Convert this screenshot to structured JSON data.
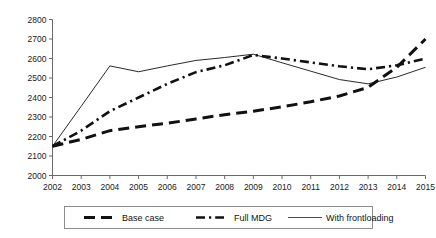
{
  "chart_data": {
    "type": "line",
    "title": "",
    "subtitle": "",
    "xlabel": "",
    "ylabel": "",
    "grid": false,
    "legend_position": "bottom",
    "x": [
      2002,
      2003,
      2004,
      2005,
      2006,
      2007,
      2008,
      2009,
      2010,
      2011,
      2012,
      2013,
      2014,
      2015
    ],
    "categories": [
      "2002",
      "2003",
      "2004",
      "2005",
      "2006",
      "2007",
      "2008",
      "2009",
      "2010",
      "2011",
      "2012",
      "2013",
      "2014",
      "2015"
    ],
    "xlim": [
      2002,
      2015
    ],
    "ylim": [
      2000,
      2800
    ],
    "yticks": [
      2000,
      2100,
      2200,
      2300,
      2400,
      2500,
      2600,
      2700,
      2800
    ],
    "ytick_labels": [
      "2000",
      "2100",
      "2200",
      "2300",
      "2400",
      "2500",
      "2600",
      "2700",
      "2800"
    ],
    "xtick_labels": [
      "2002",
      "2003",
      "2004",
      "2005",
      "2006",
      "2007",
      "2008",
      "2009",
      "2010",
      "2011",
      "2012",
      "2013",
      "2014",
      "2015"
    ],
    "series": [
      {
        "name": "Base case",
        "style": "dashed",
        "color": "#111111",
        "values": [
          2150,
          2185,
          2230,
          2250,
          2268,
          2290,
          2312,
          2330,
          2352,
          2378,
          2408,
          2452,
          2555,
          2700
        ]
      },
      {
        "name": "Full MDG",
        "style": "dash-dot",
        "color": "#111111",
        "values": [
          2150,
          2230,
          2330,
          2400,
          2470,
          2530,
          2565,
          2618,
          2600,
          2580,
          2560,
          2545,
          2565,
          2600
        ]
      },
      {
        "name": "With frontloading",
        "style": "solid",
        "color": "#3a3a3a",
        "values": [
          2150,
          2355,
          2562,
          2532,
          2562,
          2590,
          2605,
          2622,
          2578,
          2535,
          2492,
          2470,
          2505,
          2555
        ]
      }
    ]
  },
  "legend": {
    "items": [
      {
        "label": "Base case",
        "style": "dashed"
      },
      {
        "label": "Full MDG",
        "style": "dash-dot"
      },
      {
        "label": "With frontloading",
        "style": "solid"
      }
    ]
  },
  "colors": {
    "axis": "#5a5a5a",
    "series": "#111111",
    "frontloading": "#3a3a3a",
    "legend_border": "#808080",
    "background": "#ffffff"
  }
}
